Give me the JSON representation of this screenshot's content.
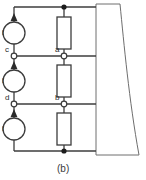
{
  "figure": {
    "caption": "(b)",
    "type": "electrical-circuit-schematic",
    "background_color": "#ffffff",
    "line_color": "#3c3c3c",
    "label_color": "#2b2b2b"
  },
  "sources": [
    {
      "id": "source-top",
      "label": "i",
      "arrow_direction": "up"
    },
    {
      "id": "source-middle",
      "label": "i",
      "arrow_direction": "up"
    },
    {
      "id": "source-bottom",
      "label": "i",
      "arrow_direction": "up"
    }
  ],
  "resistors": [
    {
      "id": "resistor-top"
    },
    {
      "id": "resistor-middle"
    },
    {
      "id": "resistor-bottom"
    }
  ],
  "nodes": [
    {
      "id": "node-c",
      "label": "c",
      "type": "open-terminal"
    },
    {
      "id": "node-d",
      "label": "d",
      "type": "open-terminal"
    },
    {
      "id": "node-a",
      "label": "a",
      "type": "open-terminal"
    },
    {
      "id": "node-b",
      "label": "b",
      "type": "open-terminal"
    }
  ],
  "junctions": [
    {
      "id": "junction-top",
      "type": "filled-dot"
    },
    {
      "id": "junction-bottom",
      "type": "filled-dot"
    }
  ],
  "rails": [
    {
      "id": "rail-top"
    },
    {
      "id": "rail-upper-middle"
    },
    {
      "id": "rail-lower-middle"
    },
    {
      "id": "rail-bottom"
    }
  ],
  "block": {
    "id": "tapered-block",
    "shape": "tapered-curved-block",
    "fill": "#ffffff"
  }
}
